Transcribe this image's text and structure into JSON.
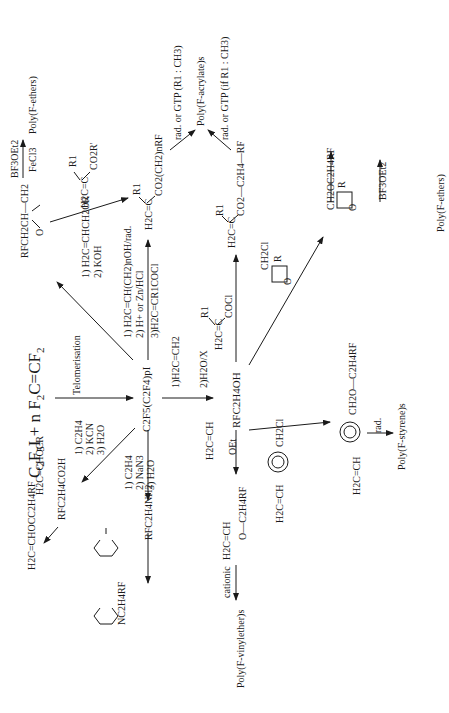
{
  "diagram": {
    "orientation": "rotated 90 degrees counter-clockwise",
    "start": {
      "reactants": "C2F5I + n F2C=CF2",
      "reactants_display": {
        "a": "C",
        "a_sub": "2",
        "b": "F",
        "b_sub": "5",
        "c": "I + n F",
        "c_sub": "2",
        "d": "C=CF",
        "d_sub": "2"
      },
      "step": "Telomerisation",
      "telomer": "C2F5(C2F4)pI"
    },
    "branches": {
      "epoxide": {
        "conditions": [
          "1) H2C=CHCH2OR",
          "2) KOH"
        ],
        "product": "RFCH2CH—CH2 (epoxide)",
        "polymerisation": {
          "above": "BF3OEt2",
          "below": "FeCl3"
        },
        "polymer": "Poly(F-ethers)"
      },
      "acrylate_from_telomer": {
        "conditions": [
          "1) H2C=CH(CH2)nOH/rad.",
          "2) H+ or Zn/HCl",
          "3)H2C=CR1COCl"
        ],
        "product": "H2C=C(R1)CO2(CH2)nRF",
        "polymerisation": "rad. or GTP (R1 : CH3)",
        "polymer": "Poly(F-acrylate)s"
      },
      "acrylate_from_alcohol": {
        "reagent": "H2C=C(R1)COCl",
        "product": "H2C=C(R1)CO2—C2H4—RF",
        "polymerisation": "rad. or GTP (if R1 : CH3)"
      },
      "alcohol": {
        "conditions": [
          "1)H2C=CH2",
          "2)H2O/X"
        ],
        "product": "RFC2H4OH"
      },
      "oxetane": {
        "reagent": "oxetane with CH2Cl and R",
        "product": "oxetane with CH2OC2H4RF and R",
        "polymerisation": "BF3OEt2",
        "polymer": "Poly(F-ethers)"
      },
      "styrene": {
        "reagent": "H2C=CH—C6H4—CH2Cl",
        "product": "H2C=CH—C6H4—CH2O—C2H4RF",
        "polymerisation": "rad.",
        "polymer": "Poly(F-styrene)s"
      },
      "vinyl_ether": {
        "reagent": "H2C=CH—OEt",
        "product": "H2C=CH—O—C2H4RF",
        "polymerisation": "cationic",
        "polymer": "Poly(F-vinylether)s"
      },
      "acid": {
        "conditions": [
          "1) C2H4",
          "2) KCN",
          "3) H2O"
        ],
        "product": "RFC2H4CO2H",
        "reagent": "H2C=CHOCR",
        "ester": "H2C=CHOCC2H4RF"
      },
      "amine": {
        "conditions": [
          "1) C2H4",
          "2) NaN3",
          "3) H2O"
        ],
        "product": "RFC2H4NH2",
        "reagent": "maleic anhydride",
        "imide": "maleimide N-C2H4RF"
      }
    },
    "labels": {
      "epox_product": "RFCH2CH—CH2",
      "epox_O": "O",
      "bf3": "BF3OEt2",
      "fecl3": "FeCl3",
      "poly_f_ethers_1": "Poly(F-ethers)",
      "epox_c1": "1) H2C=CHCH2OR",
      "epox_c2": "2) KOH",
      "acr_r1": "R1",
      "acr_left": "H2C=C",
      "acr_right": "CO2R'",
      "acr1_c1": "1) H2C=CH(CH2)nOH/rad.",
      "acr1_c2": "2) H+ or Zn/HCl",
      "acr1_c3": "3)H2C=CR1COCl",
      "acr1_left": "H2C=C",
      "acr1_right": "CO2(CH2)nRF",
      "acr1_poly": "rad. or GTP (R1 : CH3)",
      "poly_acrylates": "Poly(F-acrylate)s",
      "acr2_poly": "rad. or GTP (if R1 : CH3)",
      "acr2_left": "H2C=C",
      "acr2_right": "CO2—C2H4—RF",
      "telomerisation": "Telomerisation",
      "telomer": "C2F5(C2F4)pI",
      "alc_c1": "1)H2C=CH2",
      "alc_c2": "2)H2O/X",
      "alcohol": "RFC2H4OH",
      "acyl_left": "H2C=C",
      "acyl_right": "COCl",
      "oxetane_cl": "CH2Cl",
      "oxetane_R": "R",
      "oxetane_O": "O",
      "oxetane2_sub": "CH2OC2H4RF",
      "bf3_2": "BF3OEt2",
      "poly_f_ethers_2": "Poly(F-ethers)",
      "vinyl_reagent_top": "H2C=CH",
      "vinyl_reagent_oet": "OEt",
      "vinyl_product_top": "H2C=CH",
      "vinyl_product_o": "O—C2H4RF",
      "cationic": "cationic",
      "poly_vinylethers": "Poly(F-vinylether)s",
      "sty_reagent_vinyl": "H2C=CH",
      "sty_reagent_cl": "CH2Cl",
      "sty_product_vinyl": "H2C=CH",
      "sty_product_sub": "CH2O—C2H4RF",
      "rad": "rad.",
      "poly_styrenes": "Poly(F-styrene)s",
      "acid_c1": "1) C2H4",
      "acid_c2": "2) KCN",
      "acid_c3": "3) H2O",
      "acid": "RFC2H4CO2H",
      "vinyl_ester_reagent": "H2C=CHOCR",
      "vinyl_ester": "H2C=CHOCC2H4RF",
      "amine_c1": "1) C2H4",
      "amine_c2": "2) NaN3",
      "amine_c3": "3) H2O",
      "amine": "RFC2H4NH2",
      "imide": "NC2H4RF"
    }
  }
}
